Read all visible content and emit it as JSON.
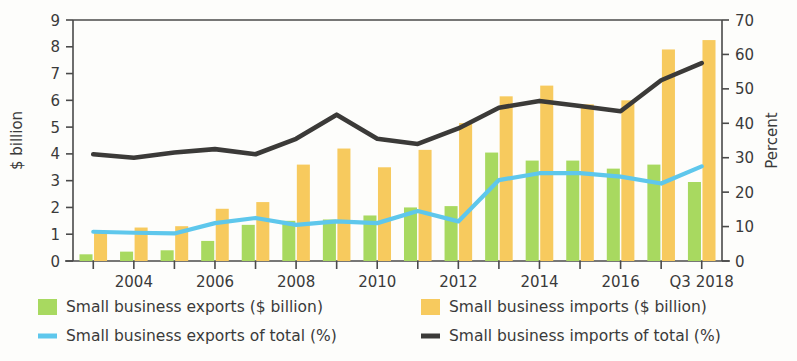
{
  "chart_data": {
    "type": "bar",
    "title": "",
    "subtitle": "",
    "xlabel": "",
    "ylabel": "$ billion",
    "y2label": "Percent",
    "ylim": [
      0,
      9
    ],
    "y2lim": [
      0,
      70
    ],
    "yticks": [
      "0",
      "1",
      "2",
      "3",
      "4",
      "5",
      "6",
      "7",
      "8",
      "9"
    ],
    "y2ticks": [
      "0",
      "10",
      "20",
      "30",
      "40",
      "50",
      "60",
      "70"
    ],
    "grid": false,
    "legend_position": "bottom",
    "categories": [
      "2003",
      "2004",
      "2005",
      "2006",
      "2007",
      "2008",
      "2009",
      "2010",
      "2011",
      "2012",
      "2013",
      "2014",
      "2015",
      "2016",
      "2017",
      "Q3 2018"
    ],
    "xtick_labels": [
      "",
      "2004",
      "",
      "2006",
      "",
      "2008",
      "",
      "2010",
      "",
      "2012",
      "",
      "2014",
      "",
      "2016",
      "",
      "Q3 2018"
    ],
    "series": [
      {
        "name": "Small business exports ($ billion)",
        "type": "bar",
        "axis": "left",
        "color": "#a8d960",
        "values": [
          0.25,
          0.35,
          0.4,
          0.75,
          1.35,
          1.5,
          1.55,
          1.7,
          2.0,
          2.05,
          4.05,
          3.75,
          3.75,
          3.45,
          3.6,
          2.95
        ]
      },
      {
        "name": "Small business imports ($ billion)",
        "type": "bar",
        "axis": "left",
        "color": "#f7ca5e",
        "values": [
          1.05,
          1.25,
          1.3,
          1.95,
          2.2,
          3.6,
          4.2,
          3.5,
          4.15,
          5.15,
          6.15,
          6.55,
          5.85,
          6.0,
          7.9,
          8.25
        ]
      },
      {
        "name": "Small business exports of total (%)",
        "type": "line",
        "axis": "right",
        "color": "#5ec7ec",
        "values": [
          8.5,
          8.2,
          8.0,
          11.0,
          12.5,
          10.5,
          11.5,
          11.0,
          14.5,
          11.5,
          23.5,
          25.5,
          25.5,
          24.5,
          22.5,
          27.5
        ]
      },
      {
        "name": "Small business imports of total (%)",
        "type": "line",
        "axis": "right",
        "color": "#3b3a38",
        "values": [
          31.0,
          30.0,
          31.5,
          32.5,
          31.0,
          35.5,
          42.5,
          35.5,
          34.0,
          38.5,
          44.5,
          46.5,
          45.0,
          43.5,
          52.5,
          57.5
        ]
      }
    ]
  },
  "axes": {
    "left_title": "$ billion",
    "right_title": "Percent"
  },
  "legend": {
    "items": [
      {
        "label": "Small business exports ($ billion)",
        "marker": "square",
        "color": "#a8d960"
      },
      {
        "label": "Small business imports ($ billion)",
        "marker": "square",
        "color": "#f7ca5e"
      },
      {
        "label": "Small business exports of total (%)",
        "marker": "line",
        "color": "#5ec7ec"
      },
      {
        "label": "Small business imports of total (%)",
        "marker": "line",
        "color": "#3b3a38"
      }
    ]
  }
}
